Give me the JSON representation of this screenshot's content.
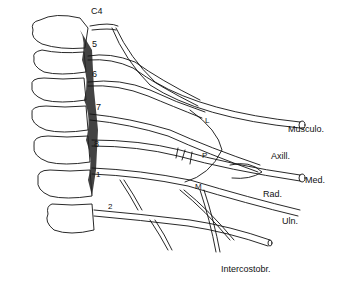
{
  "figure": {
    "root_labels": [
      "C4",
      "5",
      "6",
      "7",
      "8",
      "1",
      "2"
    ],
    "cord_labels": {
      "lateral": "L",
      "posterior": "P",
      "medial": "M"
    },
    "nerve_labels": {
      "musculocutaneous": "Musculo.",
      "axillary": "Axill.",
      "median": "Med.",
      "radial": "Rad.",
      "ulnar": "Uln.",
      "intercostobrachial": "Intercostobr."
    },
    "colors": {
      "ink": "#111111",
      "background": "#ffffff"
    }
  }
}
